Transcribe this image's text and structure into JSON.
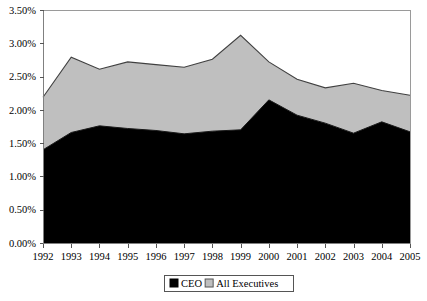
{
  "chart_data": {
    "type": "area",
    "stacked": true,
    "title": "",
    "subtitle": "",
    "xlabel": "",
    "ylabel": "",
    "grid": false,
    "legend_position": "bottom",
    "categories": [
      "1992",
      "1993",
      "1994",
      "1995",
      "1996",
      "1997",
      "1998",
      "1999",
      "2000",
      "2001",
      "2002",
      "2003",
      "2004",
      "2005"
    ],
    "x": [
      1992,
      1993,
      1994,
      1995,
      1996,
      1997,
      1998,
      1999,
      2000,
      2001,
      2002,
      2003,
      2004,
      2005
    ],
    "ylim": [
      0.0,
      3.5
    ],
    "ytick_values": [
      0.0,
      0.5,
      1.0,
      1.5,
      2.0,
      2.5,
      3.0,
      3.5
    ],
    "ytick_labels": [
      "0.00%",
      "0.50%",
      "1.00%",
      "1.50%",
      "2.00%",
      "2.50%",
      "3.00%",
      "3.50%"
    ],
    "xtick_labels": [
      "1992",
      "1993",
      "1994",
      "1995",
      "1996",
      "1997",
      "1998",
      "1999",
      "2000",
      "2001",
      "2002",
      "2003",
      "2004",
      "2005"
    ],
    "series": [
      {
        "name": "CEO",
        "color": "#000000",
        "values": [
          1.4,
          1.66,
          1.76,
          1.72,
          1.69,
          1.64,
          1.68,
          1.7,
          2.15,
          1.92,
          1.8,
          1.65,
          1.82,
          1.67
        ]
      },
      {
        "name": "All Executives",
        "color": "#bfbfbf",
        "note": "plotted as cumulative total (CEO + All Executives)",
        "totals": [
          2.19,
          2.79,
          2.61,
          2.72,
          2.68,
          2.64,
          2.76,
          3.12,
          2.72,
          2.46,
          2.33,
          2.4,
          2.29,
          2.22
        ],
        "values": [
          0.79,
          1.13,
          0.85,
          1.0,
          0.99,
          1.0,
          1.08,
          1.42,
          0.57,
          0.54,
          0.53,
          0.75,
          0.47,
          0.55
        ]
      }
    ]
  },
  "legend": {
    "items": [
      {
        "label": "CEO",
        "color": "#000000"
      },
      {
        "label": "All Executives",
        "color": "#bfbfbf"
      }
    ]
  },
  "colors": {
    "ceo_fill": "#000000",
    "all_exec_fill": "#bfbfbf",
    "series_outline": "#404040",
    "plot_border": "#9a9a9a",
    "background": "#ffffff"
  }
}
